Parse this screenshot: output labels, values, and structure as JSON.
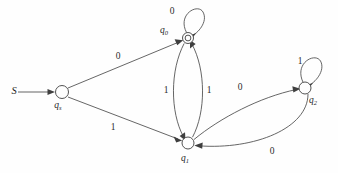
{
  "diagram": {
    "kind": "finite-state-automaton",
    "background_color": "#fefefe",
    "stroke_color": "#4a4a4a",
    "text_color": "#1f1f1f",
    "width": 338,
    "height": 173
  },
  "start": {
    "label": "S",
    "arrow_from_x": 18,
    "arrow_to_x": 55,
    "arrow_y": 92
  },
  "states": [
    {
      "id": "qs",
      "name": "q",
      "subscript": "s",
      "x": 62,
      "y": 92,
      "r": 6.5,
      "accepting": false,
      "label_x": 62,
      "label_y": 106
    },
    {
      "id": "q0",
      "name": "q",
      "subscript": "0",
      "x": 188,
      "y": 38,
      "r": 5.5,
      "accepting": true,
      "label_x": 166,
      "label_y": 33
    },
    {
      "id": "q1",
      "name": "q",
      "subscript": "1",
      "x": 188,
      "y": 143,
      "r": 6.0,
      "accepting": false,
      "label_x": 188,
      "label_y": 159
    },
    {
      "id": "q2",
      "name": "q",
      "subscript": "2",
      "x": 305,
      "y": 88,
      "r": 6.0,
      "accepting": false,
      "label_x": 316,
      "label_y": 101
    }
  ],
  "transitions": [
    {
      "id": "qs-q0",
      "from": "qs",
      "to": "q0",
      "symbol": "0",
      "label_x": 118,
      "label_y": 57
    },
    {
      "id": "qs-q1",
      "from": "qs",
      "to": "q1",
      "symbol": "1",
      "label_x": 113,
      "label_y": 128
    },
    {
      "id": "q0-q1",
      "from": "q0",
      "to": "q1",
      "symbol": "1",
      "label_x": 166,
      "label_y": 91
    },
    {
      "id": "q1-q0",
      "from": "q1",
      "to": "q0",
      "symbol": "1",
      "label_x": 209,
      "label_y": 91
    },
    {
      "id": "q1-q2",
      "from": "q1",
      "to": "q2",
      "symbol": "0",
      "label_x": 240,
      "label_y": 88
    },
    {
      "id": "q2-q1",
      "from": "q2",
      "to": "q1",
      "symbol": "0",
      "label_x": 272,
      "label_y": 152
    },
    {
      "id": "q0-q0-loop",
      "from": "q0",
      "to": "q0",
      "symbol": "0",
      "label_x": 172,
      "label_y": 12
    },
    {
      "id": "q2-q2-loop",
      "from": "q2",
      "to": "q2",
      "symbol": "1",
      "label_x": 300,
      "label_y": 62
    }
  ]
}
